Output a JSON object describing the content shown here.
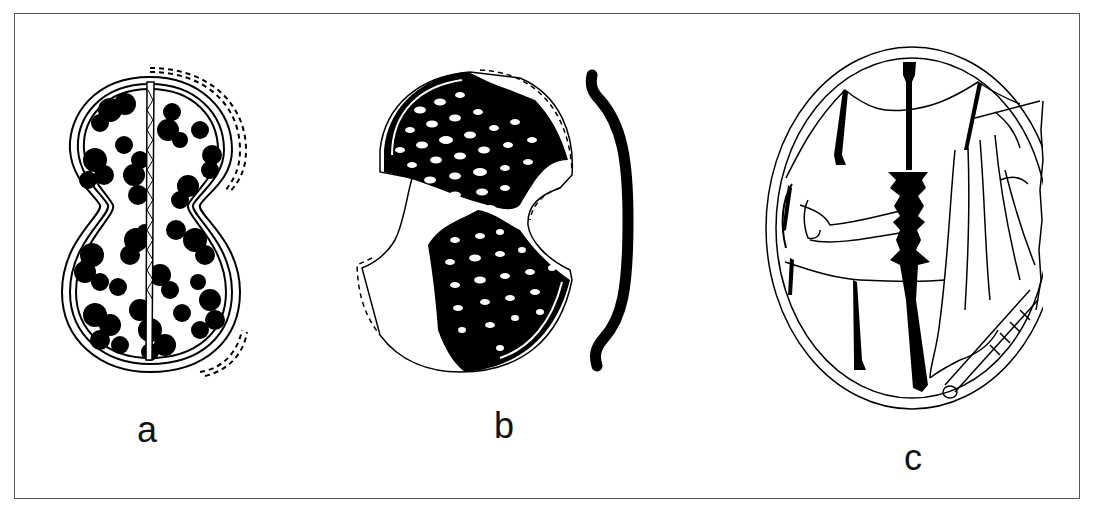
{
  "figure": {
    "panels": [
      {
        "id": "a",
        "label": "a",
        "description": "figure-eight shaped plaque with blob pattern and central serrated spine"
      },
      {
        "id": "b",
        "label": "b",
        "description": "fragmentary plaque with dark lattice pattern and section profile"
      },
      {
        "id": "c",
        "label": "c",
        "description": "oval medallion with figurative scene: standard, tassels, draped figure and hand"
      }
    ],
    "colors": {
      "ink": "#000000",
      "paper": "#ffffff",
      "frame": "#555555"
    }
  }
}
